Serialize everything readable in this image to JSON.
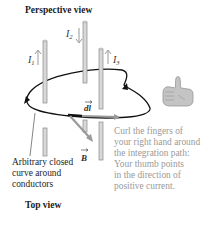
{
  "titles": {
    "perspective": "Perspective view",
    "top": "Top view"
  },
  "currents": [
    {
      "label": "I",
      "sub": "1",
      "direction": "up"
    },
    {
      "label": "I",
      "sub": "2",
      "direction": "down"
    },
    {
      "label": "I",
      "sub": "3",
      "direction": "up"
    }
  ],
  "vectors": {
    "dl": "dl",
    "B": "B"
  },
  "caption_left": {
    "lines": [
      "Arbitrary closed",
      "curve around",
      "conductors"
    ]
  },
  "caption_right": {
    "lines": [
      "Curl the fingers of",
      "your right hand around",
      "the integration path:",
      "Your thumb points",
      "in the direction of",
      "positive current."
    ]
  },
  "colors": {
    "conductor_fill": "#d8d8d8",
    "conductor_stroke": "#8a8a8a",
    "arrow_gray": "#9a9a9a",
    "curve": "#111111",
    "note_text": "#9a9a9a",
    "hand": "#c4c4c4"
  }
}
